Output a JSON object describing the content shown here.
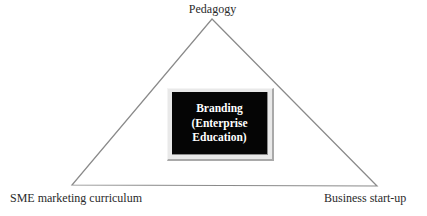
{
  "diagram": {
    "type": "triangle",
    "vertices": {
      "top": {
        "label": "Pedagogy"
      },
      "bottom_left": {
        "label": "SME marketing curriculum"
      },
      "bottom_right": {
        "label": "Business start-up"
      }
    },
    "center": {
      "lines": [
        "Branding",
        "(Enterprise",
        "Education)"
      ]
    },
    "colors": {
      "line": "#7a7a7a",
      "box_fill": "#050505",
      "box_frame": "#e9e9e9",
      "box_text": "#ffffff",
      "label_text": "#2a2a2a"
    }
  }
}
